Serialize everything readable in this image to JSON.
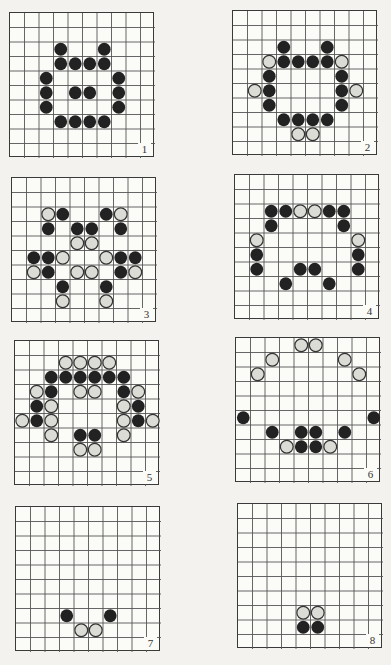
{
  "figure": {
    "grid_size": 10,
    "colors": {
      "line": "#555555",
      "black_piece": "#222222",
      "white_piece": "#dcdcd6",
      "white_stroke": "#333333"
    },
    "boards": [
      {
        "label": "1",
        "x": 9,
        "y": 12,
        "black": [
          [
            2,
            3
          ],
          [
            2,
            6
          ],
          [
            3,
            3
          ],
          [
            3,
            4
          ],
          [
            3,
            5
          ],
          [
            3,
            6
          ],
          [
            4,
            2
          ],
          [
            4,
            7
          ],
          [
            5,
            2
          ],
          [
            5,
            4
          ],
          [
            5,
            5
          ],
          [
            5,
            7
          ],
          [
            6,
            2
          ],
          [
            6,
            7
          ],
          [
            7,
            3
          ],
          [
            7,
            4
          ],
          [
            7,
            5
          ],
          [
            7,
            6
          ]
        ],
        "white": []
      },
      {
        "label": "2",
        "x": 232,
        "y": 10,
        "black": [
          [
            2,
            3
          ],
          [
            2,
            6
          ],
          [
            3,
            3
          ],
          [
            3,
            4
          ],
          [
            3,
            5
          ],
          [
            3,
            6
          ],
          [
            4,
            2
          ],
          [
            4,
            7
          ],
          [
            5,
            2
          ],
          [
            5,
            7
          ],
          [
            6,
            2
          ],
          [
            6,
            7
          ],
          [
            7,
            3
          ],
          [
            7,
            4
          ],
          [
            7,
            5
          ],
          [
            7,
            6
          ]
        ],
        "white": [
          [
            3,
            2
          ],
          [
            3,
            7
          ],
          [
            5,
            1
          ],
          [
            5,
            8
          ],
          [
            8,
            4
          ],
          [
            8,
            5
          ]
        ]
      },
      {
        "label": "3",
        "x": 11,
        "y": 177,
        "black": [
          [
            2,
            3
          ],
          [
            2,
            6
          ],
          [
            3,
            2
          ],
          [
            3,
            4
          ],
          [
            3,
            5
          ],
          [
            3,
            7
          ],
          [
            5,
            1
          ],
          [
            5,
            2
          ],
          [
            5,
            7
          ],
          [
            5,
            8
          ],
          [
            6,
            2
          ],
          [
            6,
            7
          ],
          [
            7,
            3
          ],
          [
            7,
            6
          ]
        ],
        "white": [
          [
            2,
            2
          ],
          [
            2,
            7
          ],
          [
            4,
            4
          ],
          [
            4,
            5
          ],
          [
            5,
            3
          ],
          [
            5,
            6
          ],
          [
            6,
            1
          ],
          [
            6,
            4
          ],
          [
            6,
            5
          ],
          [
            6,
            8
          ],
          [
            8,
            3
          ],
          [
            8,
            6
          ]
        ]
      },
      {
        "label": "4",
        "x": 234,
        "y": 174,
        "black": [
          [
            2,
            2
          ],
          [
            2,
            3
          ],
          [
            2,
            6
          ],
          [
            2,
            7
          ],
          [
            3,
            2
          ],
          [
            3,
            7
          ],
          [
            5,
            1
          ],
          [
            5,
            8
          ],
          [
            6,
            1
          ],
          [
            6,
            4
          ],
          [
            6,
            5
          ],
          [
            6,
            8
          ],
          [
            7,
            3
          ],
          [
            7,
            6
          ]
        ],
        "white": [
          [
            2,
            4
          ],
          [
            2,
            5
          ],
          [
            4,
            1
          ],
          [
            4,
            8
          ]
        ]
      },
      {
        "label": "5",
        "x": 14,
        "y": 340,
        "black": [
          [
            2,
            2
          ],
          [
            2,
            3
          ],
          [
            2,
            4
          ],
          [
            2,
            5
          ],
          [
            2,
            6
          ],
          [
            2,
            7
          ],
          [
            3,
            2
          ],
          [
            3,
            7
          ],
          [
            4,
            1
          ],
          [
            4,
            8
          ],
          [
            5,
            1
          ],
          [
            5,
            8
          ],
          [
            6,
            4
          ],
          [
            6,
            5
          ]
        ],
        "white": [
          [
            1,
            3
          ],
          [
            1,
            4
          ],
          [
            1,
            5
          ],
          [
            1,
            6
          ],
          [
            3,
            1
          ],
          [
            3,
            4
          ],
          [
            3,
            5
          ],
          [
            3,
            8
          ],
          [
            4,
            2
          ],
          [
            4,
            7
          ],
          [
            5,
            0
          ],
          [
            5,
            2
          ],
          [
            5,
            7
          ],
          [
            5,
            9
          ],
          [
            6,
            2
          ],
          [
            6,
            7
          ],
          [
            7,
            4
          ],
          [
            7,
            5
          ]
        ]
      },
      {
        "label": "6",
        "x": 235,
        "y": 337,
        "black": [
          [
            5,
            0
          ],
          [
            5,
            9
          ],
          [
            6,
            2
          ],
          [
            6,
            4
          ],
          [
            6,
            5
          ],
          [
            6,
            7
          ],
          [
            7,
            4
          ],
          [
            7,
            5
          ]
        ],
        "white": [
          [
            0,
            4
          ],
          [
            0,
            5
          ],
          [
            1,
            2
          ],
          [
            1,
            7
          ],
          [
            2,
            1
          ],
          [
            2,
            8
          ],
          [
            7,
            3
          ],
          [
            7,
            6
          ]
        ]
      },
      {
        "label": "7",
        "x": 15,
        "y": 506,
        "black": [
          [
            7,
            3
          ],
          [
            7,
            6
          ]
        ],
        "white": [
          [
            8,
            4
          ],
          [
            8,
            5
          ]
        ]
      },
      {
        "label": "8",
        "x": 237,
        "y": 503,
        "black": [
          [
            8,
            4
          ],
          [
            8,
            5
          ]
        ],
        "white": [
          [
            7,
            4
          ],
          [
            7,
            5
          ]
        ]
      }
    ]
  }
}
